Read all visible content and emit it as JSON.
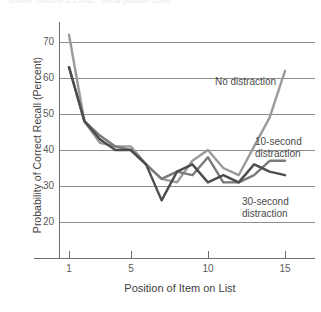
{
  "figure": {
    "top_caption": "Source: Glanzer & Cunitz  ·  serial position curve",
    "background": "#ffffff"
  },
  "axes": {
    "ylabel": "Probability of Correct Recall (Percent)",
    "xlabel": "Position of Item on List",
    "yticks": [
      "20",
      "30",
      "40",
      "50",
      "60",
      "70"
    ],
    "xticks": [
      "1",
      "5",
      "10",
      "15"
    ],
    "ylim": [
      15,
      75
    ],
    "xlim": [
      0.3,
      16.0
    ],
    "grid": "horizontal"
  },
  "annotations": {
    "no_distraction": "No distraction",
    "ten_second": "10-second\ndistraction",
    "thirty_second": "30-second\ndistraction"
  },
  "colors": {
    "no_distraction": "#9a9a9a",
    "ten_second": "#7a7a7a",
    "thirty_second": "#4d4d4d",
    "grid": "#8c8c8c",
    "axis": "#6e6e6e",
    "text": "#3f3f3f"
  },
  "chart_data": {
    "type": "line",
    "title": "",
    "xlabel": "Position of Item on List",
    "ylabel": "Probability of Correct Recall (Percent)",
    "xlim": [
      0.3,
      16.0
    ],
    "ylim": [
      15,
      75
    ],
    "grid": true,
    "legend_position": "inline-annotations",
    "x": [
      1,
      2,
      3,
      4,
      5,
      6,
      7,
      8,
      9,
      10,
      11,
      12,
      13,
      14,
      15
    ],
    "series": [
      {
        "name": "No distraction",
        "color": "#9a9a9a",
        "values": [
          72,
          48,
          42,
          41,
          41,
          36,
          32,
          31,
          37,
          40,
          35,
          33,
          41,
          49,
          62
        ]
      },
      {
        "name": "10-second distraction",
        "color": "#7a7a7a",
        "values": [
          63,
          48,
          44,
          41,
          40,
          36,
          32,
          34,
          33,
          38,
          31,
          31,
          33,
          37,
          37
        ]
      },
      {
        "name": "30-second distraction",
        "color": "#4d4d4d",
        "values": [
          63,
          48,
          43,
          40,
          40,
          36,
          26,
          34,
          36,
          31,
          33,
          31,
          36,
          34,
          33
        ]
      }
    ]
  }
}
